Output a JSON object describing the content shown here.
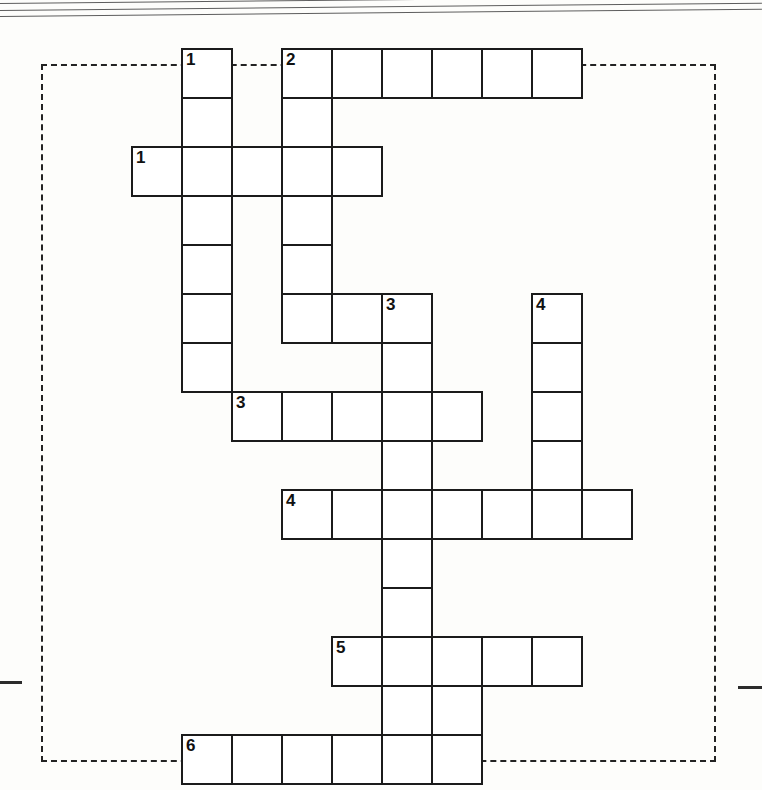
{
  "puzzle": {
    "title": "Crossword Grid",
    "cell_size": 50,
    "row_height": 49,
    "origin_x": 31,
    "origin_y": 48,
    "ink_color": "#1b1b1b",
    "cell_fill": "#ffffff",
    "page_background": "#fdfdfb",
    "frame": {
      "style": "dashed",
      "left": 41,
      "top": 64,
      "width": 671,
      "height": 694,
      "color": "#232323"
    },
    "edge_ticks": [
      {
        "name": "left-edge-tick",
        "x": 0,
        "y": 681,
        "width": 22
      },
      {
        "name": "right-edge-tick",
        "x": 738,
        "y": 686,
        "width": 24
      }
    ],
    "scan_artifacts": [
      {
        "name": "scan-line-top-1",
        "x": 0,
        "y": 3,
        "width": 762,
        "rotate": -0.55
      },
      {
        "name": "scan-line-top-2",
        "x": 0,
        "y": 10,
        "width": 762,
        "rotate": -0.55
      },
      {
        "name": "scan-line-top-3",
        "x": 0,
        "y": 16,
        "width": 762,
        "rotate": -0.55
      }
    ],
    "clue_numbers": {
      "1-down": "1",
      "2-down": "2",
      "1-across": "1",
      "3-down": "3",
      "4-down": "4",
      "3-across": "3",
      "4-across": "4",
      "5-across": "5",
      "6-across": "6"
    },
    "entries": [
      {
        "id": "1-down",
        "number": "1",
        "direction": "down",
        "col": 3,
        "row": 0,
        "length": 7
      },
      {
        "id": "2-down",
        "number": "2",
        "direction": "down",
        "col": 5,
        "row": 0,
        "length": 6
      },
      {
        "id": "2-across",
        "number": "2",
        "direction": "across",
        "col": 5,
        "row": 0,
        "length": 6
      },
      {
        "id": "1-across",
        "number": "1",
        "direction": "across",
        "col": 2,
        "row": 2,
        "length": 5
      },
      {
        "id": "3-down",
        "number": "3",
        "direction": "down",
        "col": 7,
        "row": 5,
        "length": 10
      },
      {
        "id": "4-down",
        "number": "4",
        "direction": "down",
        "col": 10,
        "row": 5,
        "length": 5
      },
      {
        "id": "3-across",
        "number": "3",
        "direction": "across",
        "col": 4,
        "row": 7,
        "length": 5
      },
      {
        "id": "4-across",
        "number": "4",
        "direction": "across",
        "col": 5,
        "row": 9,
        "length": 7
      },
      {
        "id": "5-across",
        "number": "5",
        "direction": "across",
        "col": 6,
        "row": 12,
        "length": 5
      },
      {
        "id": "6-across",
        "number": "6",
        "direction": "across",
        "col": 3,
        "row": 14,
        "length": 6
      }
    ],
    "cells": [
      {
        "col": 3,
        "row": 0,
        "number": "1",
        "letter": ""
      },
      {
        "col": 5,
        "row": 0,
        "number": "2",
        "letter": ""
      },
      {
        "col": 6,
        "row": 0,
        "number": "",
        "letter": ""
      },
      {
        "col": 7,
        "row": 0,
        "number": "",
        "letter": ""
      },
      {
        "col": 8,
        "row": 0,
        "number": "",
        "letter": ""
      },
      {
        "col": 9,
        "row": 0,
        "number": "",
        "letter": ""
      },
      {
        "col": 10,
        "row": 0,
        "number": "",
        "letter": ""
      },
      {
        "col": 3,
        "row": 1,
        "number": "",
        "letter": ""
      },
      {
        "col": 5,
        "row": 1,
        "number": "",
        "letter": ""
      },
      {
        "col": 2,
        "row": 2,
        "number": "1",
        "letter": ""
      },
      {
        "col": 3,
        "row": 2,
        "number": "",
        "letter": ""
      },
      {
        "col": 4,
        "row": 2,
        "number": "",
        "letter": ""
      },
      {
        "col": 5,
        "row": 2,
        "number": "",
        "letter": ""
      },
      {
        "col": 6,
        "row": 2,
        "number": "",
        "letter": ""
      },
      {
        "col": 3,
        "row": 3,
        "number": "",
        "letter": ""
      },
      {
        "col": 5,
        "row": 3,
        "number": "",
        "letter": ""
      },
      {
        "col": 3,
        "row": 4,
        "number": "",
        "letter": ""
      },
      {
        "col": 5,
        "row": 4,
        "number": "",
        "letter": ""
      },
      {
        "col": 3,
        "row": 5,
        "number": "",
        "letter": ""
      },
      {
        "col": 5,
        "row": 5,
        "number": "",
        "letter": ""
      },
      {
        "col": 6,
        "row": 5,
        "number": "",
        "letter": ""
      },
      {
        "col": 7,
        "row": 5,
        "number": "3",
        "letter": ""
      },
      {
        "col": 10,
        "row": 5,
        "number": "4",
        "letter": ""
      },
      {
        "col": 3,
        "row": 6,
        "number": "",
        "letter": ""
      },
      {
        "col": 7,
        "row": 6,
        "number": "",
        "letter": ""
      },
      {
        "col": 10,
        "row": 6,
        "number": "",
        "letter": ""
      },
      {
        "col": 4,
        "row": 7,
        "number": "3",
        "letter": ""
      },
      {
        "col": 5,
        "row": 7,
        "number": "",
        "letter": ""
      },
      {
        "col": 6,
        "row": 7,
        "number": "",
        "letter": ""
      },
      {
        "col": 7,
        "row": 7,
        "number": "",
        "letter": ""
      },
      {
        "col": 8,
        "row": 7,
        "number": "",
        "letter": ""
      },
      {
        "col": 10,
        "row": 7,
        "number": "",
        "letter": ""
      },
      {
        "col": 7,
        "row": 8,
        "number": "",
        "letter": ""
      },
      {
        "col": 10,
        "row": 8,
        "number": "",
        "letter": ""
      },
      {
        "col": 5,
        "row": 9,
        "number": "4",
        "letter": ""
      },
      {
        "col": 6,
        "row": 9,
        "number": "",
        "letter": ""
      },
      {
        "col": 7,
        "row": 9,
        "number": "",
        "letter": ""
      },
      {
        "col": 8,
        "row": 9,
        "number": "",
        "letter": ""
      },
      {
        "col": 9,
        "row": 9,
        "number": "",
        "letter": ""
      },
      {
        "col": 10,
        "row": 9,
        "number": "",
        "letter": ""
      },
      {
        "col": 11,
        "row": 9,
        "number": "",
        "letter": ""
      },
      {
        "col": 7,
        "row": 10,
        "number": "",
        "letter": ""
      },
      {
        "col": 7,
        "row": 11,
        "number": "",
        "letter": ""
      },
      {
        "col": 6,
        "row": 12,
        "number": "5",
        "letter": ""
      },
      {
        "col": 7,
        "row": 12,
        "number": "",
        "letter": ""
      },
      {
        "col": 8,
        "row": 12,
        "number": "",
        "letter": ""
      },
      {
        "col": 9,
        "row": 12,
        "number": "",
        "letter": ""
      },
      {
        "col": 10,
        "row": 12,
        "number": "",
        "letter": ""
      },
      {
        "col": 7,
        "row": 13,
        "number": "",
        "letter": ""
      },
      {
        "col": 8,
        "row": 13,
        "number": "",
        "letter": ""
      },
      {
        "col": 3,
        "row": 14,
        "number": "6",
        "letter": ""
      },
      {
        "col": 4,
        "row": 14,
        "number": "",
        "letter": ""
      },
      {
        "col": 5,
        "row": 14,
        "number": "",
        "letter": ""
      },
      {
        "col": 6,
        "row": 14,
        "number": "",
        "letter": ""
      },
      {
        "col": 7,
        "row": 14,
        "number": "",
        "letter": ""
      },
      {
        "col": 8,
        "row": 14,
        "number": "",
        "letter": ""
      }
    ]
  }
}
